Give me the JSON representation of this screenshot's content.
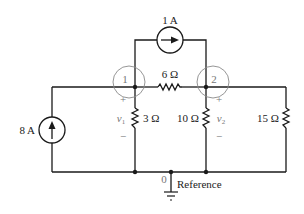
{
  "diagram": {
    "type": "circuit-schematic",
    "nodes": {
      "node1": {
        "label": "1"
      },
      "node2": {
        "label": "2"
      },
      "ground": {
        "label": "0",
        "name": "Reference"
      }
    },
    "sources": {
      "top_current": {
        "label": "1 A",
        "direction": "right",
        "from": "1",
        "to": "2"
      },
      "left_current": {
        "label": "8 A",
        "direction": "up",
        "from": "0",
        "to": "1"
      }
    },
    "resistors": {
      "r12": {
        "label": "6 Ω",
        "between": [
          "1",
          "2"
        ]
      },
      "r1": {
        "label": "3 Ω",
        "between": [
          "1",
          "0"
        ]
      },
      "r2": {
        "label": "10 Ω",
        "between": [
          "2",
          "0"
        ]
      },
      "r3": {
        "label": "15 Ω",
        "between": [
          "2",
          "0"
        ]
      }
    },
    "voltages": {
      "v1": {
        "symbol": "v",
        "subscript": "1",
        "plus": "+",
        "minus": "−"
      },
      "v2": {
        "symbol": "v",
        "subscript": "2",
        "plus": "+",
        "minus": "−"
      }
    },
    "colors": {
      "wire": "#1a1a1a",
      "node_circle": "#8a8a8a",
      "text": "#222222",
      "polarity": "#777777"
    }
  }
}
